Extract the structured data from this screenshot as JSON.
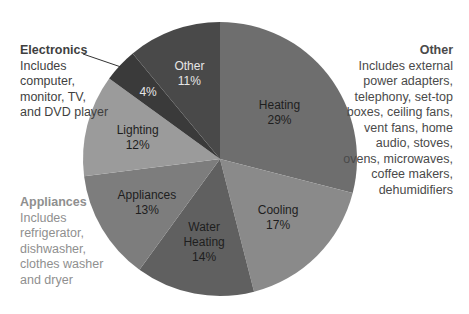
{
  "chart_data": {
    "type": "pie",
    "title": "",
    "start_angle_deg": 0,
    "direction": "clockwise",
    "categories": [
      "Heating",
      "Cooling",
      "Water Heating",
      "Appliances",
      "Lighting",
      "Electronics",
      "Other"
    ],
    "values": [
      29,
      17,
      14,
      13,
      12,
      4,
      11
    ],
    "unit": "%",
    "slices": [
      {
        "name": "Heating",
        "label_lines": [
          "Heating",
          "29%"
        ],
        "value": 29,
        "color": "#6e6e6e",
        "text_color": "#1e1e1e"
      },
      {
        "name": "Cooling",
        "label_lines": [
          "Cooling",
          "17%"
        ],
        "value": 17,
        "color": "#8a8a8a",
        "text_color": "#1e1e1e"
      },
      {
        "name": "Water Heating",
        "label_lines": [
          "Water",
          "Heating",
          "14%"
        ],
        "value": 14,
        "color": "#606060",
        "text_color": "#1e1e1e"
      },
      {
        "name": "Appliances",
        "label_lines": [
          "Appliances",
          "13%"
        ],
        "value": 13,
        "color": "#7d7d7d",
        "text_color": "#1e1e1e"
      },
      {
        "name": "Lighting",
        "label_lines": [
          "Lighting",
          "12%"
        ],
        "value": 12,
        "color": "#9b9b9b",
        "text_color": "#1e1e1e"
      },
      {
        "name": "Electronics",
        "label_lines": [
          "4%"
        ],
        "value": 4,
        "color": "#3a3a3a",
        "text_color": "#e6e6e6"
      },
      {
        "name": "Other",
        "label_lines": [
          "Other",
          "11%"
        ],
        "value": 11,
        "color": "#494949",
        "text_color": "#e6e6e6"
      }
    ],
    "annotations": [
      {
        "target": "Electronics",
        "title": "Electronics",
        "text": "Includes computer, monitor, TV, and DVD player",
        "position": "left-top",
        "leader_line": true
      },
      {
        "target": "Appliances",
        "title": "Appliances",
        "text": "Includes refrigerator, dishwasher, clothes washer and dryer",
        "position": "left-bottom"
      },
      {
        "target": "Other",
        "title": "Other",
        "text": "Includes external power adapters, telephony, set-top boxes, ceiling fans, vent fans, home audio, stoves, ovens, microwaves, coffee makers, dehumidifiers",
        "position": "right"
      }
    ],
    "legend": "none"
  },
  "notes": {
    "electronics": {
      "title": "Electronics",
      "body": "Includes computer, monitor, TV, and DVD player"
    },
    "appliances": {
      "title": "Appliances",
      "body": "Includes refrigerator, dishwasher, clothes washer and dryer"
    },
    "other": {
      "title": "Other",
      "body": "Includes external power adapters, telephony, set-top boxes, ceiling fans, vent fans, home audio, stoves, ovens, microwaves, coffee makers, dehumidifiers"
    }
  }
}
